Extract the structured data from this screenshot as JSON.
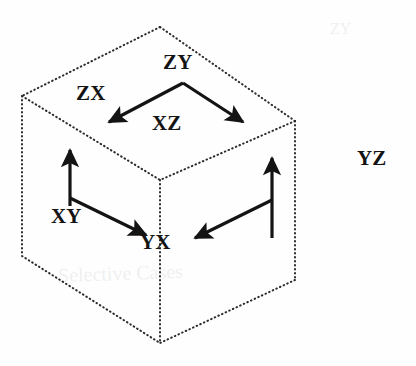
{
  "figure": {
    "type": "diagram",
    "subtitle": "isometric cube with directed transition arrows",
    "background_color": "#fefefe",
    "ink_color": "#141414",
    "cube": {
      "stroke_style": "dotted",
      "stroke_color": "#2b2b2b",
      "vertices": {
        "top": [
          160,
          27
        ],
        "top_left": [
          22,
          96
        ],
        "top_right": [
          295,
          121
        ],
        "center": [
          160,
          180
        ],
        "bottom_left": [
          22,
          256
        ],
        "bottom_right": [
          295,
          280
        ],
        "bottom": [
          160,
          343
        ]
      }
    },
    "labels": [
      {
        "id": "zy",
        "text": "ZY",
        "x": 163,
        "y": 52
      },
      {
        "id": "zx",
        "text": "ZX",
        "x": 76,
        "y": 83
      },
      {
        "id": "xz",
        "text": "XZ",
        "x": 152,
        "y": 113
      },
      {
        "id": "xy",
        "text": "XY",
        "x": 51,
        "y": 206
      },
      {
        "id": "yx",
        "text": "YX",
        "x": 140,
        "y": 232
      },
      {
        "id": "yz",
        "text": "YZ",
        "x": 357,
        "y": 148
      }
    ],
    "arrows": [
      {
        "id": "zy-to-zx",
        "from_label": "ZY",
        "to_label": "ZX",
        "start": [
          183,
          83
        ],
        "end": [
          105,
          125
        ],
        "direction": "down-left",
        "head": "filled-triangle"
      },
      {
        "id": "zy-to-xz",
        "from_label": "ZY",
        "to_label": "XZ",
        "start": [
          183,
          83
        ],
        "end": [
          247,
          125
        ],
        "direction": "down-right",
        "head": "filled-triangle"
      },
      {
        "id": "xy-up",
        "from_label": "XY",
        "to_label": "ZX",
        "start": [
          70,
          205
        ],
        "end": [
          70,
          145
        ],
        "direction": "up",
        "head": "filled-triangle"
      },
      {
        "id": "xy-to-yx",
        "from_label": "XY",
        "to_label": "YX",
        "start": [
          70,
          198
        ],
        "end": [
          150,
          237
        ],
        "direction": "down-right",
        "head": "filled-triangle"
      },
      {
        "id": "yz-up",
        "from_label": "YZ",
        "to_label": "XZ",
        "start": [
          272,
          238
        ],
        "end": [
          272,
          153
        ],
        "direction": "up",
        "head": "filled-triangle"
      },
      {
        "id": "yz-to-yx",
        "from_label": "YZ",
        "to_label": "YX",
        "start": [
          272,
          200
        ],
        "end": [
          190,
          240
        ],
        "direction": "down-left",
        "head": "filled-triangle"
      }
    ],
    "background_bleed": [
      {
        "id": "ghost-1",
        "text": "Selective Cases",
        "x": 58,
        "y": 262,
        "rotation": -2
      },
      {
        "id": "ghost-2",
        "text": "ZY",
        "x": 330,
        "y": 20,
        "rotation": 0
      }
    ]
  }
}
